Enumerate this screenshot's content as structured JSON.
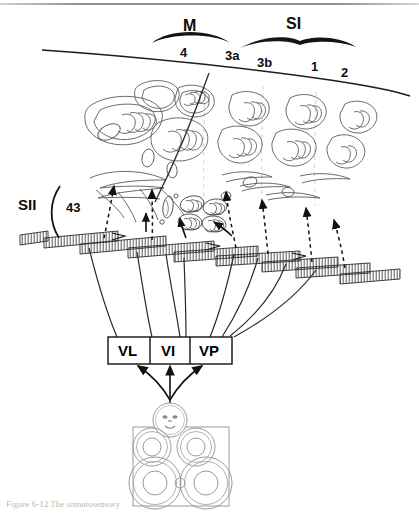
{
  "figure": {
    "caption": "Figure 6-12 The somatosensory"
  },
  "cortex_labels": {
    "motor_group": "M",
    "somatosensory_group": "SI",
    "secondary_somatosensory": "SII",
    "areas": [
      {
        "name": "area-4",
        "label": "4",
        "x": 189,
        "y": 46
      },
      {
        "name": "area-3a",
        "label": "3a",
        "x": 236,
        "y": 50
      },
      {
        "name": "area-3b",
        "label": "3b",
        "x": 268,
        "y": 56
      },
      {
        "name": "area-1",
        "label": "1",
        "x": 317,
        "y": 62
      },
      {
        "name": "area-2",
        "label": "2",
        "x": 347,
        "y": 67
      }
    ],
    "sii_area": "43"
  },
  "thalamus": {
    "nuclei": [
      {
        "name": "nucleus-vl",
        "label": "VL",
        "x": 110,
        "y": 337,
        "w": 42,
        "h": 27
      },
      {
        "name": "nucleus-vi",
        "label": "VI",
        "x": 152,
        "y": 337,
        "w": 38,
        "h": 27
      },
      {
        "name": "nucleus-vp",
        "label": "VP",
        "x": 190,
        "y": 337,
        "w": 42,
        "h": 27
      }
    ]
  },
  "body_map": {
    "name": "body-representation",
    "face": "face-circle",
    "regions": [
      "upper-left-limb",
      "upper-right-limb",
      "lower-left-limb",
      "lower-right-limb"
    ]
  },
  "colors": {
    "ink": "#1a1a1a",
    "outline": "#3c3c3c",
    "faint": "#c9c9c9",
    "paper": "#ffffff"
  }
}
